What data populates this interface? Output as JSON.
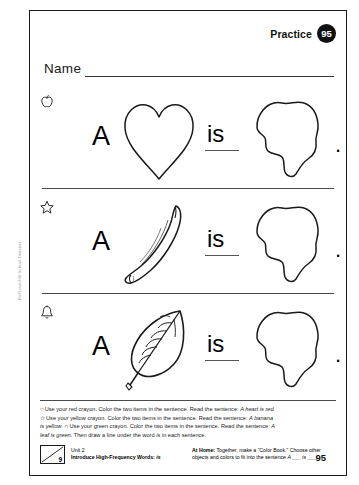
{
  "header": {
    "practice_label": "Practice",
    "practice_number": "95",
    "name_label": "Name"
  },
  "rows": [
    {
      "icon": "apple-icon",
      "letter": "A",
      "picture": "heart-outline",
      "word": "is",
      "blank": "blob-outline",
      "period": "."
    },
    {
      "icon": "star-icon",
      "letter": "A",
      "picture": "banana-outline",
      "word": "is",
      "blank": "blob-outline",
      "period": "."
    },
    {
      "icon": "bell-icon",
      "letter": "A",
      "picture": "leaf-outline",
      "word": "is",
      "blank": "blob-outline",
      "period": "."
    }
  ],
  "instructions": {
    "line1_glyph": "○",
    "line1_a": "Use your red crayon. Color the two items in the sentence. Read the sentence: ",
    "line1_i": "A heart is red.",
    "line2_glyph": "☆",
    "line2_a": "Use your yellow crayon. Color the two items in the sentence. Read the sentence: ",
    "line2_i": "A banana",
    "line3_ia": "is yellow.",
    "line3_glyph": "∩",
    "line3_a": "Use your green crayon. Color the two items in the sentence. Read the sentence: ",
    "line3_i": "A",
    "line4_i": "leaf is green.",
    "line4_a": " Then draw a line under the word ",
    "line4_i2": "is",
    "line4_b": " in each sentence."
  },
  "footer": {
    "box_number": "9",
    "unit": "Unit 2",
    "lesson_prefix": "Introduce High-Frequency Words: ",
    "lesson_word": "is",
    "at_home_label": "At Home:",
    "at_home_text": " Together, make a “Color Book.” Choose other objects and colors to fit into the sentence ",
    "at_home_frame": "A ___ is ___.",
    "page_number": "95"
  },
  "side_credit": "McGraw-Hill School Division"
}
